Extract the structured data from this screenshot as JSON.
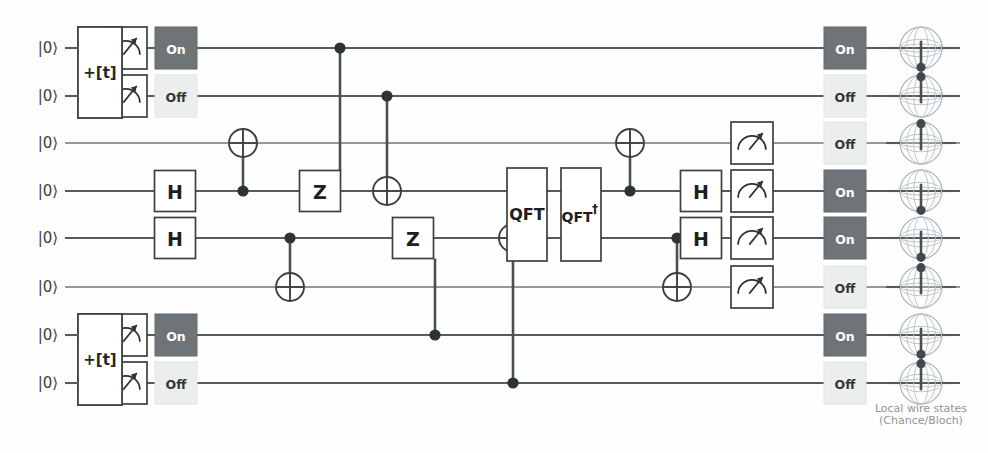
{
  "diagram": {
    "background_color": "#fefefe",
    "width": 988,
    "height": 453
  },
  "caption": {
    "line1": "Local wire states",
    "line2": "(Chance/Bloch)"
  },
  "colors": {
    "wire": "#555a5e",
    "gate_stroke": "#3b4044",
    "on_fill": "#6e7478",
    "on_text": "#ffffff",
    "off_fill": "#eceeee",
    "off_text": "#31363a",
    "control_dot": "#2e3336",
    "bloch_outline": "#a9aeb2",
    "bloch_needle": "#4a4f53",
    "caption": "#8e9498"
  },
  "wires": [
    {
      "index": 0,
      "y": 48,
      "ket": "|0⟩"
    },
    {
      "index": 1,
      "y": 96,
      "ket": "|0⟩"
    },
    {
      "index": 2,
      "y": 143,
      "ket": "|0⟩"
    },
    {
      "index": 3,
      "y": 191,
      "ket": "|0⟩"
    },
    {
      "index": 4,
      "y": 238,
      "ket": "|0⟩"
    },
    {
      "index": 5,
      "y": 287,
      "ket": "|0⟩"
    },
    {
      "index": 6,
      "y": 335,
      "ket": "|0⟩"
    },
    {
      "index": 7,
      "y": 383,
      "ket": "|0⟩"
    }
  ],
  "source_blocks": [
    {
      "name": "top-source",
      "label": "+[t]",
      "x": 78,
      "y": 27,
      "width": 44,
      "height": 91,
      "wires": [
        0,
        1
      ]
    },
    {
      "name": "bottom-source",
      "label": "+[t]",
      "x": 78,
      "y": 314,
      "width": 44,
      "height": 91,
      "wires": [
        6,
        7
      ]
    }
  ],
  "gates": [
    {
      "id": "m-top-0",
      "type": "measure",
      "label": "measure",
      "wire": 0,
      "x": 126,
      "size": 42
    },
    {
      "id": "m-top-1",
      "type": "measure",
      "label": "measure",
      "wire": 1,
      "x": 126,
      "size": 42
    },
    {
      "id": "m-bot-6",
      "type": "measure",
      "label": "measure",
      "wire": 6,
      "x": 126,
      "size": 42
    },
    {
      "id": "m-bot-7",
      "type": "measure",
      "label": "measure",
      "wire": 7,
      "x": 126,
      "size": 42
    },
    {
      "id": "h-w3",
      "type": "H",
      "label": "H",
      "wire": 3,
      "x": 175,
      "size": 41
    },
    {
      "id": "h-w4",
      "type": "H",
      "label": "H",
      "wire": 4,
      "x": 175,
      "size": 41
    },
    {
      "id": "z-upper",
      "type": "Z",
      "label": "Z",
      "wire": 3,
      "x": 320,
      "size": 41
    },
    {
      "id": "z-lower",
      "type": "Z",
      "label": "Z",
      "wire": 4,
      "x": 413,
      "size": 41
    },
    {
      "id": "qft",
      "type": "QFT",
      "label": "QFT",
      "x": 507,
      "y": 168,
      "width": 40,
      "height": 93,
      "wires": [
        3,
        4
      ]
    },
    {
      "id": "qft-dag",
      "type": "QFTd",
      "label": "QFT",
      "dagger": "†",
      "x": 561,
      "y": 168,
      "width": 40,
      "height": 93,
      "wires": [
        3,
        4
      ]
    },
    {
      "id": "h-w3-r",
      "type": "H",
      "label": "H",
      "wire": 3,
      "x": 701,
      "size": 41
    },
    {
      "id": "h-w4-r",
      "type": "H",
      "label": "H",
      "wire": 4,
      "x": 701,
      "size": 41
    },
    {
      "id": "m-r-2",
      "type": "measure",
      "label": "measure",
      "wire": 2,
      "x": 752,
      "size": 42
    },
    {
      "id": "m-r-3",
      "type": "measure",
      "label": "measure",
      "wire": 3,
      "x": 752,
      "size": 42
    },
    {
      "id": "m-r-4",
      "type": "measure",
      "label": "measure",
      "wire": 4,
      "x": 752,
      "size": 42
    },
    {
      "id": "m-r-5",
      "type": "measure",
      "label": "measure",
      "wire": 5,
      "x": 752,
      "size": 42
    }
  ],
  "cnots": [
    {
      "id": "cx-1",
      "target_wire": 2,
      "control_wire": 3,
      "x": 243,
      "radius": 14
    },
    {
      "id": "cx-2",
      "target_wire": 5,
      "control_wire": 4,
      "x": 290,
      "radius": 14
    },
    {
      "id": "cx-3",
      "target_wire": 3,
      "control_wire": 1,
      "x": 387,
      "radius": 14
    },
    {
      "id": "cx-4",
      "target_wire": 4,
      "control_wire": 7,
      "x": 513,
      "radius": 14
    },
    {
      "id": "cx-5",
      "target_wire": 2,
      "control_wire": 3,
      "x": 630,
      "radius": 14
    },
    {
      "id": "cx-6",
      "target_wire": 5,
      "control_wire": 4,
      "x": 677,
      "radius": 14
    }
  ],
  "controlled_gate_links": [
    {
      "id": "ctrl-z-upper",
      "control_wire": 0,
      "gate_id": "z-upper",
      "x": 340
    },
    {
      "id": "ctrl-z-lower",
      "control_wire": 6,
      "gate_id": "z-lower",
      "x": 435
    }
  ],
  "indicator_columns": [
    {
      "name": "left-indicators",
      "x": 176,
      "size": 42,
      "items": [
        {
          "wire": 0,
          "state": "On"
        },
        {
          "wire": 1,
          "state": "Off"
        },
        {
          "wire": 6,
          "state": "On"
        },
        {
          "wire": 7,
          "state": "Off"
        }
      ]
    },
    {
      "name": "right-indicators",
      "x": 845,
      "size": 42,
      "items": [
        {
          "wire": 0,
          "state": "On"
        },
        {
          "wire": 1,
          "state": "Off"
        },
        {
          "wire": 2,
          "state": "Off"
        },
        {
          "wire": 3,
          "state": "On"
        },
        {
          "wire": 4,
          "state": "On"
        },
        {
          "wire": 5,
          "state": "Off"
        },
        {
          "wire": 6,
          "state": "On"
        },
        {
          "wire": 7,
          "state": "Off"
        }
      ]
    }
  ],
  "bloch_spheres": [
    {
      "wire": 0,
      "x": 921,
      "radius": 21,
      "needle_direction": "down"
    },
    {
      "wire": 1,
      "x": 921,
      "radius": 21,
      "needle_direction": "up"
    },
    {
      "wire": 2,
      "x": 921,
      "radius": 21,
      "needle_direction": "up"
    },
    {
      "wire": 3,
      "x": 921,
      "radius": 21,
      "needle_direction": "down"
    },
    {
      "wire": 4,
      "x": 921,
      "radius": 21,
      "needle_direction": "down"
    },
    {
      "wire": 5,
      "x": 921,
      "radius": 21,
      "needle_direction": "up"
    },
    {
      "wire": 6,
      "x": 921,
      "radius": 21,
      "needle_direction": "down"
    },
    {
      "wire": 7,
      "x": 921,
      "radius": 21,
      "needle_direction": "up"
    }
  ],
  "labels": {
    "ket_x": 48,
    "wire_start_x": 65,
    "wire_end_x": 960
  }
}
